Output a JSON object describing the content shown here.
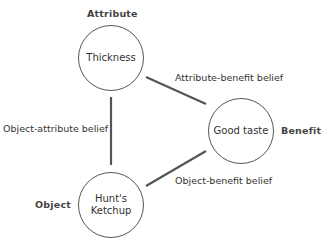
{
  "diagram": {
    "type": "belief-triangle",
    "nodes": {
      "attribute": {
        "role": "Attribute",
        "label": "Thickness"
      },
      "benefit": {
        "role": "Benefit",
        "label": "Good taste"
      },
      "object": {
        "role": "Object",
        "label_line1": "Hunt's",
        "label_line2": "Ketchup"
      }
    },
    "edges": {
      "object_attribute": {
        "label": "Object-attribute belief",
        "from": "Object",
        "to": "Attribute"
      },
      "attribute_benefit": {
        "label": "Attribute-benefit belief",
        "from": "Attribute",
        "to": "Benefit"
      },
      "object_benefit": {
        "label": "Object-benefit belief",
        "from": "Object",
        "to": "Benefit"
      }
    },
    "colors": {
      "line": "#555555",
      "circle_border": "#555555",
      "text": "#333333"
    }
  }
}
